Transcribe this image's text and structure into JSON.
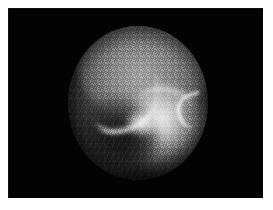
{
  "image": {
    "modality_label": "fluoroscopic radiograph",
    "anatomy_label": "knee joint",
    "view_shape": "circular field of view",
    "caption": "",
    "background_color": "#ffffff",
    "plate_color": "#030303",
    "highlight_color": "#ffffff",
    "midtone_color": "#8e8e8e",
    "shadow_color": "#141414"
  },
  "plate": {
    "x": 8,
    "y": 8,
    "width": 255,
    "height": 190
  },
  "field_of_view": {
    "center_x": 138,
    "center_y": 103,
    "radius_x": 70,
    "radius_y": 77
  },
  "features": [
    {
      "name": "upper-condyle-mass",
      "description": "rounded bright bone mass occupying the upper half of the field"
    },
    {
      "name": "joint-line-left-limb",
      "description": "bright curved cortical line descending from upper left toward centre"
    },
    {
      "name": "joint-line-right-limb",
      "description": "bright cortical line rising from centre toward the right"
    },
    {
      "name": "joint-apex",
      "description": "brightest convergence point of the V-shaped joint line"
    },
    {
      "name": "tibial-plateau-glow",
      "description": "broad bright region in the lower right quadrant"
    },
    {
      "name": "lower-left-condyle-shadow",
      "description": "dark rounded shadow in the lower left quadrant"
    },
    {
      "name": "right-hook-highlight",
      "description": "small bright hooked highlight near the right border"
    },
    {
      "name": "intensifier-grid-texture",
      "description": "faint orthogonal grid texture from the image intensifier"
    },
    {
      "name": "mesh-texture",
      "description": "fine diagonal mesh texture over the darker lower-left region"
    },
    {
      "name": "vignette",
      "description": "circular darkening blending the field of view into the black surround"
    }
  ]
}
